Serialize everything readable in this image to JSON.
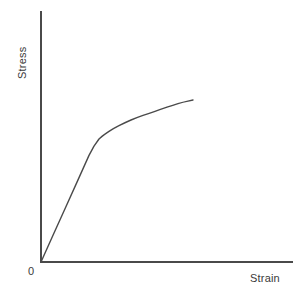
{
  "chart_data": {
    "type": "line",
    "title": "",
    "subtitle": "",
    "xlabel": "Strain",
    "ylabel": "Stress",
    "origin_label": "0",
    "grid": false,
    "legend": null,
    "annotations": [],
    "axis_color": "#4a4a4a",
    "line_color": "#4a4a4a",
    "background_color": "#ffffff",
    "xlim": [
      0,
      1
    ],
    "ylim": [
      0,
      1
    ],
    "axes": {
      "x_axis_from": [
        0,
        0
      ],
      "x_axis_to": [
        1,
        0
      ],
      "y_axis_from": [
        0,
        0
      ],
      "y_axis_to": [
        0,
        1
      ]
    },
    "series": [
      {
        "name": "stress-strain curve",
        "description": "Elastic linear region up to yield point, then strain-hardening plateau",
        "x": [
          0.0,
          0.06,
          0.12,
          0.18,
          0.24,
          0.265,
          0.29,
          0.32,
          0.36,
          0.42,
          0.48,
          0.54,
          0.6,
          0.66,
          0.71,
          0.76
        ],
        "y": [
          0.0,
          0.13,
          0.26,
          0.39,
          0.52,
          0.565,
          0.6,
          0.625,
          0.65,
          0.68,
          0.705,
          0.725,
          0.745,
          0.765,
          0.78,
          0.79
        ]
      }
    ],
    "features": {
      "yield_point": {
        "x": 0.29,
        "y": 0.6,
        "label": ""
      },
      "curve_end": {
        "x": 0.76,
        "y": 0.79
      }
    }
  }
}
